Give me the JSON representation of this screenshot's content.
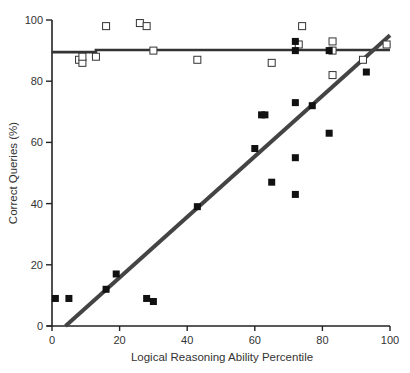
{
  "chart_data": {
    "type": "scatter",
    "title": "",
    "xlabel": "Logical Reasoning Ability Percentile",
    "ylabel": "Correct Queries (%)",
    "xlim": [
      0,
      100
    ],
    "ylim": [
      0,
      100
    ],
    "x_ticks": [
      0,
      20,
      40,
      60,
      80,
      100
    ],
    "y_ticks": [
      0,
      20,
      40,
      60,
      80,
      100
    ],
    "x_tick_labels": [
      "0",
      "20",
      "40",
      "60",
      "80",
      "100"
    ],
    "y_tick_labels": [
      "0",
      "20",
      "40",
      "60",
      "80",
      "100"
    ],
    "grid": false,
    "legend": null,
    "series": [
      {
        "name": "Open squares",
        "marker": "open-square",
        "color": "#333333",
        "points": [
          {
            "x": 8,
            "y": 87
          },
          {
            "x": 9,
            "y": 86
          },
          {
            "x": 9,
            "y": 88
          },
          {
            "x": 13,
            "y": 88
          },
          {
            "x": 16,
            "y": 98
          },
          {
            "x": 26,
            "y": 99
          },
          {
            "x": 28,
            "y": 98
          },
          {
            "x": 30,
            "y": 90
          },
          {
            "x": 43,
            "y": 87
          },
          {
            "x": 65,
            "y": 86
          },
          {
            "x": 73,
            "y": 92
          },
          {
            "x": 74,
            "y": 98
          },
          {
            "x": 83,
            "y": 93
          },
          {
            "x": 83,
            "y": 90
          },
          {
            "x": 83,
            "y": 82
          },
          {
            "x": 92,
            "y": 87
          },
          {
            "x": 99,
            "y": 92
          }
        ],
        "fit_line": {
          "x": [
            0,
            13,
            13,
            100
          ],
          "y": [
            89.5,
            89.5,
            90.2,
            90.2
          ]
        }
      },
      {
        "name": "Filled squares",
        "marker": "filled-square",
        "color": "#111111",
        "points": [
          {
            "x": 1,
            "y": 9
          },
          {
            "x": 5,
            "y": 9
          },
          {
            "x": 16,
            "y": 12
          },
          {
            "x": 19,
            "y": 17
          },
          {
            "x": 28,
            "y": 9
          },
          {
            "x": 30,
            "y": 8
          },
          {
            "x": 43,
            "y": 39
          },
          {
            "x": 60,
            "y": 58
          },
          {
            "x": 62,
            "y": 69
          },
          {
            "x": 63,
            "y": 69
          },
          {
            "x": 65,
            "y": 47
          },
          {
            "x": 72,
            "y": 93
          },
          {
            "x": 72,
            "y": 90
          },
          {
            "x": 72,
            "y": 73
          },
          {
            "x": 72,
            "y": 55
          },
          {
            "x": 72,
            "y": 43
          },
          {
            "x": 77,
            "y": 72
          },
          {
            "x": 82,
            "y": 90
          },
          {
            "x": 82,
            "y": 63
          },
          {
            "x": 93,
            "y": 83
          }
        ],
        "fit_line": {
          "x": [
            4,
            100
          ],
          "y": [
            0,
            95
          ]
        }
      }
    ]
  }
}
